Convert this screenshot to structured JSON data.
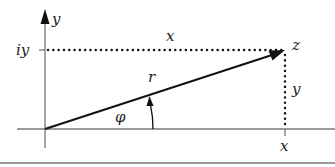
{
  "diagram": {
    "labels": {
      "y_axis": "y",
      "iy_tick": "iy",
      "x_top": "x",
      "z_point": "z",
      "r_magnitude": "r",
      "y_side": "y",
      "phi_angle": "φ",
      "x_tick": "x"
    },
    "colors": {
      "axis": "#777777",
      "vector": "#111111",
      "dotted": "#111111",
      "text": "#222222"
    }
  }
}
